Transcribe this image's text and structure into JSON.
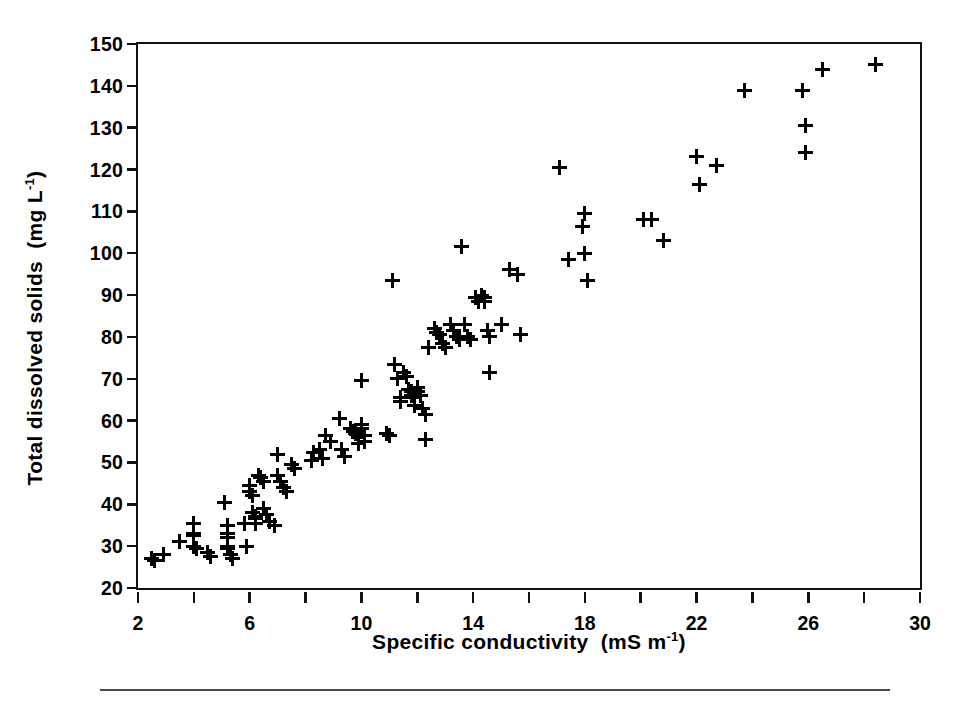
{
  "figure": {
    "background_color": "#ffffff",
    "ink_color": "#000000",
    "rule_color": "#4a4a4a"
  },
  "axes": {
    "x_title_main": "Specific conductivity",
    "x_title_units_prefix": "(mS  m",
    "x_title_units_sup": "-1",
    "x_title_units_suffix": ")",
    "y_title_main": "Total dissolved solids",
    "y_title_units_prefix": "(mg  L",
    "y_title_units_sup": "-1",
    "y_title_units_suffix": ")"
  },
  "chart_data": {
    "type": "scatter",
    "title": "",
    "xlabel": "Specific conductivity  (mS m-1)",
    "ylabel": "Total dissolved solids  (mg L-1)",
    "xlim": [
      2,
      30
    ],
    "ylim": [
      20,
      150
    ],
    "xticks": [
      2,
      6,
      10,
      14,
      18,
      22,
      26,
      30
    ],
    "xticklabels": [
      "2",
      "6",
      "10",
      "14",
      "18",
      "22",
      "26",
      "30"
    ],
    "xminorticks": [
      4,
      8,
      12,
      16,
      20,
      24,
      28
    ],
    "yticks": [
      20,
      30,
      40,
      50,
      60,
      70,
      80,
      90,
      100,
      110,
      120,
      130,
      140,
      150
    ],
    "yticklabels": [
      "20",
      "30",
      "40",
      "50",
      "60",
      "70",
      "80",
      "90",
      "100",
      "110",
      "120",
      "130",
      "140",
      "150"
    ],
    "grid": false,
    "legend": null,
    "marker": "plus",
    "marker_color": "#000000",
    "series": [
      {
        "name": "samples",
        "points": [
          [
            2.5,
            27.0
          ],
          [
            2.6,
            26.5
          ],
          [
            2.9,
            28.0
          ],
          [
            3.5,
            31.0
          ],
          [
            4.0,
            35.5
          ],
          [
            4.0,
            33.0
          ],
          [
            4.0,
            32.5
          ],
          [
            4.0,
            30.0
          ],
          [
            4.1,
            29.5
          ],
          [
            4.5,
            28.5
          ],
          [
            4.6,
            27.5
          ],
          [
            5.1,
            40.5
          ],
          [
            5.2,
            35.0
          ],
          [
            5.2,
            33.0
          ],
          [
            5.2,
            32.0
          ],
          [
            5.2,
            30.0
          ],
          [
            5.2,
            29.5
          ],
          [
            5.3,
            28.0
          ],
          [
            5.4,
            27.0
          ],
          [
            5.8,
            35.5
          ],
          [
            5.9,
            30.0
          ],
          [
            6.0,
            44.5
          ],
          [
            6.0,
            43.0
          ],
          [
            6.1,
            42.0
          ],
          [
            6.1,
            38.0
          ],
          [
            6.2,
            37.0
          ],
          [
            6.2,
            36.5
          ],
          [
            6.2,
            35.5
          ],
          [
            6.3,
            47.0
          ],
          [
            6.4,
            46.5
          ],
          [
            6.5,
            45.5
          ],
          [
            6.5,
            39.0
          ],
          [
            6.6,
            37.5
          ],
          [
            6.7,
            36.0
          ],
          [
            6.9,
            35.0
          ],
          [
            7.0,
            52.0
          ],
          [
            7.0,
            47.0
          ],
          [
            7.1,
            45.5
          ],
          [
            7.2,
            44.0
          ],
          [
            7.3,
            43.0
          ],
          [
            7.5,
            49.5
          ],
          [
            7.6,
            48.5
          ],
          [
            8.2,
            50.5
          ],
          [
            8.3,
            52.5
          ],
          [
            8.5,
            53.0
          ],
          [
            8.6,
            51.0
          ],
          [
            8.7,
            56.5
          ],
          [
            8.9,
            55.0
          ],
          [
            9.2,
            60.5
          ],
          [
            9.3,
            53.0
          ],
          [
            9.4,
            51.5
          ],
          [
            9.6,
            58.0
          ],
          [
            9.7,
            57.5
          ],
          [
            9.8,
            57.0
          ],
          [
            9.9,
            56.0
          ],
          [
            9.9,
            54.5
          ],
          [
            10.0,
            69.5
          ],
          [
            10.0,
            59.0
          ],
          [
            10.0,
            58.0
          ],
          [
            10.1,
            56.5
          ],
          [
            10.1,
            55.0
          ],
          [
            10.9,
            57.0
          ],
          [
            11.0,
            56.5
          ],
          [
            11.1,
            93.5
          ],
          [
            11.2,
            73.5
          ],
          [
            11.3,
            70.0
          ],
          [
            11.4,
            65.5
          ],
          [
            11.4,
            64.5
          ],
          [
            11.5,
            71.5
          ],
          [
            11.6,
            70.5
          ],
          [
            11.7,
            67.5
          ],
          [
            11.8,
            67.0
          ],
          [
            11.8,
            66.0
          ],
          [
            11.9,
            65.5
          ],
          [
            11.9,
            63.5
          ],
          [
            12.0,
            68.0
          ],
          [
            12.0,
            67.0
          ],
          [
            12.1,
            66.0
          ],
          [
            12.2,
            63.0
          ],
          [
            12.3,
            61.5
          ],
          [
            12.3,
            55.5
          ],
          [
            12.4,
            77.5
          ],
          [
            12.6,
            82.0
          ],
          [
            12.7,
            81.0
          ],
          [
            12.8,
            80.5
          ],
          [
            12.9,
            78.5
          ],
          [
            13.0,
            77.5
          ],
          [
            13.2,
            83.0
          ],
          [
            13.3,
            81.5
          ],
          [
            13.4,
            80.0
          ],
          [
            13.5,
            79.5
          ],
          [
            13.6,
            101.5
          ],
          [
            13.7,
            83.0
          ],
          [
            13.8,
            80.0
          ],
          [
            13.9,
            79.5
          ],
          [
            14.1,
            89.5
          ],
          [
            14.2,
            88.5
          ],
          [
            14.3,
            90.0
          ],
          [
            14.4,
            89.5
          ],
          [
            14.4,
            88.5
          ],
          [
            14.5,
            81.5
          ],
          [
            14.6,
            80.0
          ],
          [
            14.6,
            71.5
          ],
          [
            15.0,
            83.0
          ],
          [
            15.3,
            96.0
          ],
          [
            15.6,
            95.0
          ],
          [
            15.7,
            80.5
          ],
          [
            17.1,
            120.5
          ],
          [
            17.4,
            98.5
          ],
          [
            17.9,
            106.5
          ],
          [
            18.0,
            109.5
          ],
          [
            18.0,
            100.0
          ],
          [
            18.1,
            93.5
          ],
          [
            20.1,
            108.0
          ],
          [
            20.4,
            108.0
          ],
          [
            20.8,
            103.0
          ],
          [
            22.0,
            123.0
          ],
          [
            22.1,
            116.5
          ],
          [
            22.7,
            121.0
          ],
          [
            23.7,
            139.0
          ],
          [
            25.8,
            139.0
          ],
          [
            25.9,
            130.5
          ],
          [
            25.9,
            124.0
          ],
          [
            26.5,
            144.0
          ],
          [
            28.4,
            145.0
          ]
        ]
      }
    ]
  }
}
